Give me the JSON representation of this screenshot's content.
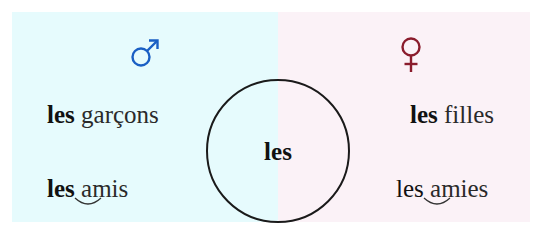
{
  "colors": {
    "masculine_bg": "#e6fbfd",
    "feminine_bg": "#fbf2f7",
    "masculine_symbol": "#1a5fc4",
    "feminine_symbol": "#8a1c2c",
    "text": "#1e1e1e"
  },
  "masculine": {
    "symbol": "male-symbol",
    "phrases": [
      {
        "determiner": "les",
        "noun": "garçons",
        "liaison": false
      },
      {
        "determiner": "les",
        "noun": "amis",
        "liaison": true
      }
    ]
  },
  "feminine": {
    "symbol": "female-symbol",
    "phrases": [
      {
        "determiner": "les",
        "noun": "filles",
        "liaison": false
      },
      {
        "determiner": "les",
        "noun": "amies",
        "liaison": true
      }
    ]
  },
  "center": {
    "label": "les"
  }
}
